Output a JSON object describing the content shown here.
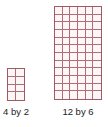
{
  "figures": [
    {
      "id": "small",
      "label": "4 by 2",
      "rows": 4,
      "cols": 2,
      "line_color": "#a05a66"
    },
    {
      "id": "large",
      "label": "12 by 6",
      "rows": 12,
      "cols": 6,
      "line_color": "#a05a66"
    }
  ]
}
